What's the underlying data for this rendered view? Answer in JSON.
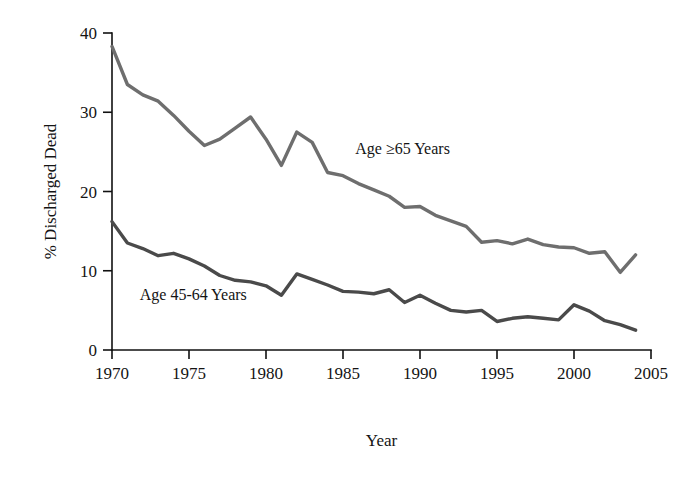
{
  "chart_data": {
    "type": "line",
    "title": "",
    "subtitle": "",
    "xlabel": "Year",
    "ylabel": "% Discharged Dead",
    "xlim": [
      1970,
      2005
    ],
    "ylim": [
      0,
      40
    ],
    "xticks": [
      1970,
      1975,
      1980,
      1985,
      1990,
      1995,
      2000,
      2005
    ],
    "yticks": [
      0,
      10,
      20,
      30,
      40
    ],
    "grid": false,
    "legend_position": "inline-annotation",
    "x": [
      1970,
      1971,
      1972,
      1973,
      1974,
      1975,
      1976,
      1977,
      1978,
      1979,
      1980,
      1981,
      1982,
      1983,
      1984,
      1985,
      1986,
      1987,
      1988,
      1989,
      1990,
      1991,
      1992,
      1993,
      1994,
      1995,
      1996,
      1997,
      1998,
      1999,
      2000,
      2001,
      2002,
      2003,
      2004
    ],
    "series": [
      {
        "name": "Age ≥65 Years",
        "color": "#6e6e6e",
        "values": [
          38.3,
          33.5,
          32.2,
          31.4,
          29.6,
          27.6,
          25.8,
          26.6,
          28.0,
          29.4,
          26.6,
          23.3,
          27.5,
          26.2,
          22.4,
          22.0,
          21.0,
          20.2,
          19.4,
          18.0,
          18.1,
          17.0,
          16.3,
          15.6,
          13.6,
          13.8,
          13.4,
          14.0,
          13.3,
          13.0,
          12.9,
          12.2,
          12.4,
          9.8,
          12.0
        ]
      },
      {
        "name": "Age 45-64 Years",
        "color": "#4a4a4a",
        "values": [
          16.2,
          13.5,
          12.8,
          11.9,
          12.2,
          11.5,
          10.6,
          9.4,
          8.8,
          8.6,
          8.1,
          6.9,
          9.6,
          8.9,
          8.2,
          7.4,
          7.3,
          7.1,
          7.6,
          6.0,
          6.9,
          5.9,
          5.0,
          4.8,
          5.0,
          3.6,
          4.0,
          4.2,
          4.0,
          3.8,
          5.7,
          4.9,
          3.7,
          3.2,
          2.5
        ]
      }
    ],
    "annotations": [
      {
        "text": "Age ≥65 Years",
        "x": 1985.8,
        "y": 24.7
      },
      {
        "text": "Age 45-64 Years",
        "x": 1971.8,
        "y": 6.3
      }
    ]
  }
}
